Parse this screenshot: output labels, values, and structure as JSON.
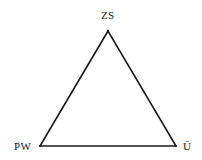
{
  "diagram": {
    "type": "triangle",
    "vertices": [
      {
        "id": "top",
        "label": "ZS",
        "x": 108,
        "y": 31
      },
      {
        "id": "left",
        "label": "PW",
        "x": 40,
        "y": 146
      },
      {
        "id": "right",
        "label": "Ü",
        "x": 176,
        "y": 146
      }
    ],
    "edges": [
      {
        "from": "ZS",
        "to": "PW"
      },
      {
        "from": "ZS",
        "to": "Ü"
      },
      {
        "from": "PW",
        "to": "Ü"
      }
    ],
    "colors": {
      "line": "#1a1a1a",
      "background": "#ffffff"
    }
  }
}
